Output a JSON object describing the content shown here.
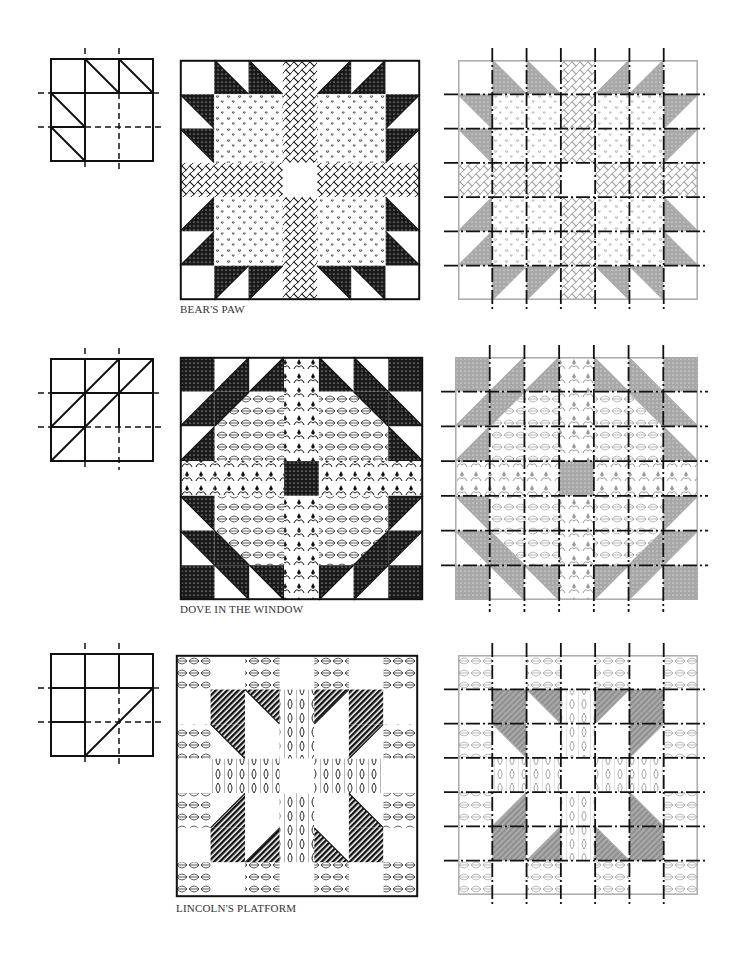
{
  "page": {
    "blocks": [
      {
        "name": "Bear's Paw",
        "caption": "BEAR'S PAW",
        "grid": 7,
        "diagram": "bears-paw-3x3-key",
        "colors": {
          "dark": "#1a1a1a",
          "light": "#ffffff",
          "gray": "#a8a8a8",
          "outline": "#222222"
        }
      },
      {
        "name": "Dove in the Window",
        "caption": "DOVE IN THE WINDOW",
        "grid": 7,
        "diagram": "dove-in-the-window-3x3-key",
        "colors": {
          "dark": "#1a1a1a",
          "light": "#ffffff",
          "gray": "#a8a8a8",
          "outline": "#222222"
        }
      },
      {
        "name": "Lincoln's Platform",
        "caption": "LINCOLN'S PLATFORM",
        "grid": 7,
        "diagram": "lincolns-platform-3x3-key",
        "colors": {
          "dark": "#1a1a1a",
          "light": "#ffffff",
          "gray": "#a8a8a8",
          "outline": "#222222"
        }
      }
    ]
  }
}
